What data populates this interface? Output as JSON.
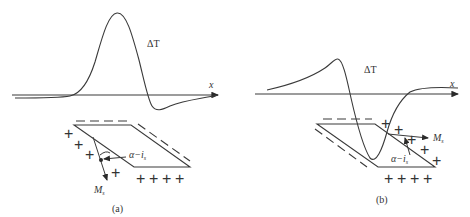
{
  "figure": {
    "panels": [
      {
        "id": "a",
        "caption": "(a)",
        "curve_label": "ΔT",
        "axis_label": "x",
        "vector_label": "M",
        "vector_subscript": "s",
        "angle_label": "α−i",
        "angle_subscript": "s",
        "charges_left": [
          "+",
          "+",
          "+",
          "+"
        ],
        "charges_bottom": [
          "+",
          "+",
          "+",
          "+"
        ],
        "charges_other": [
          "+"
        ]
      },
      {
        "id": "b",
        "caption": "(b)",
        "curve_label": "ΔT",
        "axis_label": "x",
        "vector_label": "M",
        "vector_subscript": "s",
        "angle_label": "α−i",
        "angle_subscript": "s",
        "charges_right": [
          "+",
          "+",
          "+",
          "+",
          "+"
        ],
        "charges_bottom": [
          "+",
          "+",
          "+",
          "+"
        ]
      }
    ]
  }
}
